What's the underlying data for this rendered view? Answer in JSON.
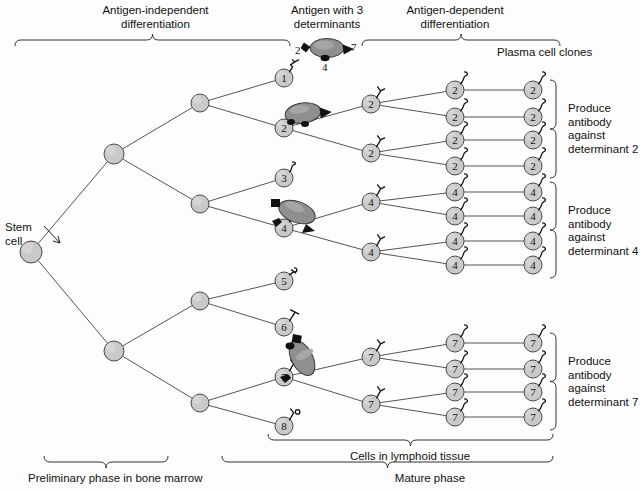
{
  "figure": {
    "title_top_left": "Antigen-independent\ndifferentiation",
    "title_top_mid": "Antigen with 3\ndeterminants",
    "title_top_right": "Antigen-dependent\ndifferentiation",
    "label_plasma_clones": "Plasma cell clones",
    "label_stem_cell": "Stem\ncell",
    "label_bottom_left": "Preliminary phase in bone ",
    "label_bottom_left_italic": "marrow",
    "label_bottom_mid": "Cells in lymphoid tissue",
    "label_bottom_right": "Mature phase",
    "groups": [
      {
        "id": "group-2",
        "text": "Produce\nantibody\nagainst\ndeterminant 2"
      },
      {
        "id": "group-4",
        "text": "Produce\nantibody\nagainst\ndeterminant 4"
      },
      {
        "id": "group-7",
        "text": "Produce\nantibody\nagainst\ndeterminant 7"
      }
    ],
    "antigen": {
      "name": "antigen-particle",
      "determinant_left": "2",
      "determinant_bottom": "4",
      "determinant_right": "7"
    },
    "colors": {
      "cell_fill": "#c9c9c9",
      "cell_stroke": "#4a4a4a",
      "antigen_fill": "#8f8f8f",
      "antigen_stroke": "#3a3a3a",
      "determinant_fill": "#111111",
      "line": "#555555",
      "brace": "#333333",
      "text": "#111111",
      "background": "#fdfdfd"
    },
    "stem_cell": {
      "name": "stem-cell",
      "cx": 31,
      "cy": 252,
      "r": 11
    },
    "progenitors": [
      {
        "name": "progenitor-upper",
        "cx": 114,
        "cy": 154,
        "r": 10
      },
      {
        "name": "progenitor-lower",
        "cx": 114,
        "cy": 351,
        "r": 10
      },
      {
        "name": "progenitor-upper-a",
        "cx": 200,
        "cy": 103,
        "r": 9
      },
      {
        "name": "progenitor-upper-b",
        "cx": 200,
        "cy": 204,
        "r": 9
      },
      {
        "name": "progenitor-lower-a",
        "cx": 200,
        "cy": 301,
        "r": 9
      },
      {
        "name": "progenitor-lower-b",
        "cx": 200,
        "cy": 403,
        "r": 9
      }
    ],
    "lymphocytes": [
      {
        "name": "lymphocyte-1",
        "label": "1",
        "cx": 284,
        "cy": 78,
        "r": 9,
        "receptor": "zigzag"
      },
      {
        "name": "lymphocyte-2",
        "label": "2",
        "cx": 284,
        "cy": 128,
        "r": 9,
        "receptor": "hook"
      },
      {
        "name": "lymphocyte-3",
        "label": "3",
        "cx": 284,
        "cy": 178,
        "r": 9,
        "receptor": "squiggle"
      },
      {
        "name": "lymphocyte-4",
        "label": "4",
        "cx": 284,
        "cy": 228,
        "r": 9,
        "receptor": "fork"
      },
      {
        "name": "lymphocyte-5",
        "label": "5",
        "cx": 284,
        "cy": 281,
        "r": 9,
        "receptor": "double"
      },
      {
        "name": "lymphocyte-6",
        "label": "6",
        "cx": 284,
        "cy": 327,
        "r": 9,
        "receptor": "tee"
      },
      {
        "name": "lymphocyte-7",
        "label": "7",
        "cx": 284,
        "cy": 377,
        "r": 9,
        "receptor": "fork"
      },
      {
        "name": "lymphocyte-8",
        "label": "8",
        "cx": 284,
        "cy": 426,
        "r": 9,
        "receptor": "circlet"
      }
    ],
    "mid_clones": [
      {
        "name": "clone-mid-2a",
        "label": "2",
        "cx": 371,
        "cy": 104,
        "r": 9
      },
      {
        "name": "clone-mid-2b",
        "label": "2",
        "cx": 371,
        "cy": 153,
        "r": 9
      },
      {
        "name": "clone-mid-4a",
        "label": "4",
        "cx": 371,
        "cy": 202,
        "r": 9
      },
      {
        "name": "clone-mid-4b",
        "label": "4",
        "cx": 371,
        "cy": 252,
        "r": 9
      },
      {
        "name": "clone-mid-7a",
        "label": "7",
        "cx": 371,
        "cy": 357,
        "r": 9
      },
      {
        "name": "clone-mid-7b",
        "label": "7",
        "cx": 371,
        "cy": 404,
        "r": 9
      }
    ],
    "inner_clones": [
      {
        "name": "clone-inner-2-1",
        "label": "2",
        "cx": 455,
        "cy": 90,
        "r": 9
      },
      {
        "name": "clone-inner-2-2",
        "label": "2",
        "cx": 455,
        "cy": 117,
        "r": 9
      },
      {
        "name": "clone-inner-2-3",
        "label": "2",
        "cx": 455,
        "cy": 140,
        "r": 9
      },
      {
        "name": "clone-inner-2-4",
        "label": "2",
        "cx": 455,
        "cy": 166,
        "r": 9
      },
      {
        "name": "clone-inner-4-1",
        "label": "4",
        "cx": 455,
        "cy": 192,
        "r": 9
      },
      {
        "name": "clone-inner-4-2",
        "label": "4",
        "cx": 455,
        "cy": 216,
        "r": 9
      },
      {
        "name": "clone-inner-4-3",
        "label": "4",
        "cx": 455,
        "cy": 241,
        "r": 9
      },
      {
        "name": "clone-inner-4-4",
        "label": "4",
        "cx": 455,
        "cy": 265,
        "r": 9
      },
      {
        "name": "clone-inner-7-1",
        "label": "7",
        "cx": 455,
        "cy": 343,
        "r": 9
      },
      {
        "name": "clone-inner-7-2",
        "label": "7",
        "cx": 455,
        "cy": 369,
        "r": 9
      },
      {
        "name": "clone-inner-7-3",
        "label": "7",
        "cx": 455,
        "cy": 392,
        "r": 9
      },
      {
        "name": "clone-inner-7-4",
        "label": "7",
        "cx": 455,
        "cy": 417,
        "r": 9
      }
    ],
    "outer_clones": [
      {
        "name": "clone-outer-2-1",
        "label": "2",
        "cx": 533,
        "cy": 90,
        "r": 9
      },
      {
        "name": "clone-outer-2-2",
        "label": "2",
        "cx": 533,
        "cy": 117,
        "r": 9
      },
      {
        "name": "clone-outer-2-3",
        "label": "2",
        "cx": 533,
        "cy": 140,
        "r": 9
      },
      {
        "name": "clone-outer-2-4",
        "label": "2",
        "cx": 533,
        "cy": 166,
        "r": 9
      },
      {
        "name": "clone-outer-4-1",
        "label": "4",
        "cx": 533,
        "cy": 192,
        "r": 9
      },
      {
        "name": "clone-outer-4-2",
        "label": "4",
        "cx": 533,
        "cy": 216,
        "r": 9
      },
      {
        "name": "clone-outer-4-3",
        "label": "4",
        "cx": 533,
        "cy": 241,
        "r": 9
      },
      {
        "name": "clone-outer-4-4",
        "label": "4",
        "cx": 533,
        "cy": 265,
        "r": 9
      },
      {
        "name": "clone-outer-7-1",
        "label": "7",
        "cx": 533,
        "cy": 343,
        "r": 9
      },
      {
        "name": "clone-outer-7-2",
        "label": "7",
        "cx": 533,
        "cy": 369,
        "r": 9
      },
      {
        "name": "clone-outer-7-3",
        "label": "7",
        "cx": 533,
        "cy": 392,
        "r": 9
      },
      {
        "name": "clone-outer-7-4",
        "label": "7",
        "cx": 533,
        "cy": 417,
        "r": 9
      }
    ]
  }
}
